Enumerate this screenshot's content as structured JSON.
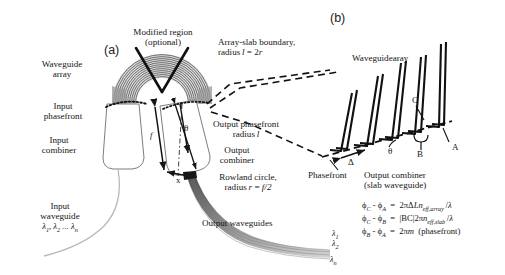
{
  "figure": {
    "background": "#ffffff",
    "ink": "#141414",
    "panels": [
      {
        "tag": "(a)",
        "name": "awg-layout"
      },
      {
        "tag": "(b)",
        "name": "array-slab-detail"
      }
    ]
  },
  "panel_a": {
    "tag": "(a)",
    "labels": {
      "modified_region_l1": "Modified region",
      "modified_region_l2": "(optional)",
      "waveguide_array_l1": "Waveguide",
      "waveguide_array_l2": "array",
      "array_slab_boundary_l1": "Array-slab boundary,",
      "array_slab_boundary_l2": "radius l = 2r",
      "input_phasefront_l1": "Input",
      "input_phasefront_l2": "phasefront",
      "input_combiner_l1": "Input",
      "input_combiner_l2": "combiner",
      "output_phasefront_l1": "Output phasefront",
      "output_phasefront_l2": "radius l",
      "output_combiner_l1": "Output",
      "output_combiner_l2": "combiner",
      "rowland_circle_l1": "Rowland circle,",
      "rowland_circle_l2": "radius r = f/2",
      "input_waveguide_l1": "Input",
      "input_waveguide_l2": "waveguide",
      "input_waveguide_lambdas": "λ1, λ2 ... λn",
      "output_waveguides": "Output waveguides",
      "dim_f": "f",
      "dim_l": "l",
      "dim_x": "x",
      "angle_theta": "θ",
      "out_lambda_1": "λ1",
      "out_lambda_2": "λ2",
      "out_lambda_n": "λn"
    }
  },
  "panel_b": {
    "tag": "(b)",
    "labels": {
      "waveguide_array": "Waveguidearay",
      "phasefront": "Phasefront",
      "output_combiner_l1": "Output combiner",
      "output_combiner_l2": "(slab waveguide)",
      "point_a": "A",
      "point_b": "B",
      "point_c": "C",
      "delta": "Δ",
      "angle_theta": "θ"
    },
    "equations": [
      "ϕC - ϕA  =  2πΔLneff,array /λ",
      "ϕC - ϕB  =  |BC|2πneff,slab /λ",
      "ϕB - ϕA  =  2πm  (phasefront)"
    ],
    "equation_parts": [
      {
        "lhs": "ϕ",
        "lhs_sub": "C",
        "minus": "-",
        "rhs_sym": "ϕ",
        "rhs_sub": "A",
        "eq": "=",
        "expr": "2πΔLn",
        "expr_sub": "eff,array",
        "tail": "/λ"
      },
      {
        "lhs": "ϕ",
        "lhs_sub": "C",
        "minus": "-",
        "rhs_sym": "ϕ",
        "rhs_sub": "B",
        "eq": "=",
        "expr": "|BC|2πn",
        "expr_sub": "eff,slab",
        "tail": "/λ"
      },
      {
        "lhs": "ϕ",
        "lhs_sub": "B",
        "minus": "-",
        "rhs_sym": "ϕ",
        "rhs_sub": "A",
        "eq": "=",
        "expr": "2πm",
        "expr_sub": "",
        "tail": "(phasefront)"
      }
    ]
  }
}
